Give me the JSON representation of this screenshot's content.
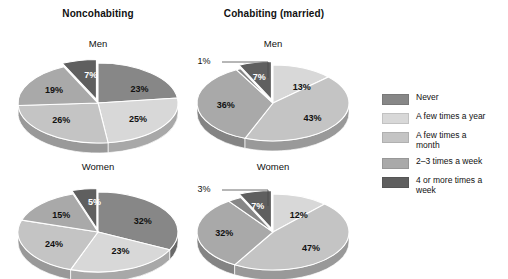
{
  "figure": {
    "group_titles": [
      {
        "id": "noncohabiting",
        "label": "Noncohabiting"
      },
      {
        "id": "cohabiting",
        "label": "Cohabiting (married)"
      }
    ],
    "panel_titles": {
      "men": "Men",
      "women": "Women"
    }
  },
  "legend": {
    "position": "right",
    "items": [
      {
        "label": "Never",
        "color": "#878787"
      },
      {
        "label": "A few times a year",
        "color": "#d8d8d8"
      },
      {
        "label": "A few times a\nmonth",
        "color": "#c4c4c4"
      },
      {
        "label": "2–3 times a week",
        "color": "#a9a9a9"
      },
      {
        "label": "4 or more times a\nweek",
        "color": "#5f5f5f"
      }
    ]
  },
  "chart_data": [
    {
      "type": "pie",
      "id": "noncohabiting-men",
      "title": "Noncohabiting",
      "subtitle": "Men",
      "categories": [
        "Never",
        "A few times a year",
        "A few times a month",
        "2–3 times a week",
        "4 or more times a week"
      ],
      "values": [
        23,
        25,
        26,
        19,
        7
      ],
      "labels": [
        "23%",
        "25%",
        "26%",
        "19%",
        "7%"
      ],
      "colors": [
        "#878787",
        "#d8d8d8",
        "#c4c4c4",
        "#a9a9a9",
        "#5f5f5f"
      ],
      "xlabel": "",
      "ylabel": "",
      "grid": false
    },
    {
      "type": "pie",
      "id": "cohabiting-men",
      "title": "Cohabiting (married)",
      "subtitle": "Men",
      "categories": [
        "Never",
        "A few times a year",
        "A few times a month",
        "2–3 times a week",
        "4 or more times a week"
      ],
      "values": [
        13,
        43,
        36,
        1,
        7
      ],
      "labels": [
        "13%",
        "43%",
        "36%",
        "1%",
        "7%"
      ],
      "colors": [
        "#d8d8d8",
        "#c4c4c4",
        "#a9a9a9",
        "#878787",
        "#5f5f5f"
      ],
      "callouts": [
        "1%"
      ],
      "xlabel": "",
      "ylabel": "",
      "grid": false
    },
    {
      "type": "pie",
      "id": "noncohabiting-women",
      "title": "Noncohabiting",
      "subtitle": "Women",
      "categories": [
        "Never",
        "A few times a year",
        "A few times a month",
        "2–3 times a week",
        "4 or more times a week"
      ],
      "values": [
        32,
        23,
        24,
        15,
        5
      ],
      "labels": [
        "32%",
        "23%",
        "24%",
        "15%",
        "5%"
      ],
      "colors": [
        "#878787",
        "#d8d8d8",
        "#c4c4c4",
        "#a9a9a9",
        "#5f5f5f"
      ],
      "xlabel": "",
      "ylabel": "",
      "grid": false
    },
    {
      "type": "pie",
      "id": "cohabiting-women",
      "title": "Cohabiting (married)",
      "subtitle": "Women",
      "categories": [
        "Never",
        "A few times a year",
        "A few times a month",
        "2–3 times a week",
        "4 or more times a week"
      ],
      "values": [
        12,
        47,
        32,
        3,
        7
      ],
      "labels": [
        "12%",
        "47%",
        "32%",
        "3%",
        "7%"
      ],
      "colors": [
        "#d8d8d8",
        "#c4c4c4",
        "#a9a9a9",
        "#878787",
        "#5f5f5f"
      ],
      "callouts": [
        "3%"
      ],
      "xlabel": "",
      "ylabel": "",
      "grid": false
    }
  ],
  "pie_geometry": [
    {
      "id": "noncohabiting-men",
      "cx": 98,
      "cy": 103,
      "rx": 80,
      "ry": 40,
      "depth": 10,
      "start_deg": -90,
      "slices": [
        {
          "v": 23,
          "color": "#878787",
          "label": "23%",
          "lx": 0.52,
          "ly": -0.34,
          "light": false
        },
        {
          "v": 25,
          "color": "#d8d8d8",
          "label": "25%",
          "lx": 0.5,
          "ly": 0.4,
          "light": false
        },
        {
          "v": 26,
          "color": "#c4c4c4",
          "label": "26%",
          "lx": -0.46,
          "ly": 0.42,
          "light": false
        },
        {
          "v": 19,
          "color": "#a9a9a9",
          "label": "19%",
          "lx": -0.55,
          "ly": -0.32,
          "light": false
        },
        {
          "v": 7,
          "color": "#5f5f5f",
          "label": "7%",
          "lx": -0.07,
          "ly": -0.62,
          "light": true,
          "explode": 8
        }
      ]
    },
    {
      "id": "cohabiting-men",
      "cx": 273,
      "cy": 103,
      "rx": 76,
      "ry": 38,
      "depth": 10,
      "start_deg": -90,
      "slices": [
        {
          "v": 13,
          "color": "#d8d8d8",
          "label": "13%",
          "lx": 0.38,
          "ly": -0.42,
          "light": false
        },
        {
          "v": 43,
          "color": "#c4c4c4",
          "label": "43%",
          "lx": 0.52,
          "ly": 0.4,
          "light": false
        },
        {
          "v": 36,
          "color": "#a9a9a9",
          "label": "36%",
          "lx": -0.62,
          "ly": 0.05,
          "light": false
        },
        {
          "v": 1,
          "color": "#878787",
          "label": "",
          "lx": -0.3,
          "ly": -0.7,
          "light": false
        },
        {
          "v": 7,
          "color": "#5f5f5f",
          "label": "7%",
          "lx": -0.16,
          "ly": -0.6,
          "light": true,
          "explode": 8
        }
      ],
      "callout": {
        "text": "1%",
        "tx": 204,
        "ty": 64,
        "path": "M 222 62 L 268 62 L 268 78"
      }
    },
    {
      "id": "noncohabiting-women",
      "cx": 98,
      "cy": 232,
      "rx": 80,
      "ry": 40,
      "depth": 10,
      "start_deg": -90,
      "slices": [
        {
          "v": 32,
          "color": "#878787",
          "label": "32%",
          "lx": 0.56,
          "ly": -0.28,
          "light": false
        },
        {
          "v": 23,
          "color": "#d8d8d8",
          "label": "23%",
          "lx": 0.28,
          "ly": 0.48,
          "light": false
        },
        {
          "v": 24,
          "color": "#c4c4c4",
          "label": "24%",
          "lx": -0.55,
          "ly": 0.3,
          "light": false
        },
        {
          "v": 15,
          "color": "#a9a9a9",
          "label": "15%",
          "lx": -0.46,
          "ly": -0.42,
          "light": false
        },
        {
          "v": 5,
          "color": "#5f5f5f",
          "label": "5%",
          "lx": -0.03,
          "ly": -0.66,
          "light": true,
          "explode": 8
        }
      ]
    },
    {
      "id": "cohabiting-women",
      "cx": 273,
      "cy": 232,
      "rx": 76,
      "ry": 38,
      "depth": 10,
      "start_deg": -90,
      "slices": [
        {
          "v": 12,
          "color": "#d8d8d8",
          "label": "12%",
          "lx": 0.34,
          "ly": -0.44,
          "light": false
        },
        {
          "v": 47,
          "color": "#c4c4c4",
          "label": "47%",
          "lx": 0.5,
          "ly": 0.42,
          "light": false
        },
        {
          "v": 32,
          "color": "#a9a9a9",
          "label": "32%",
          "lx": -0.64,
          "ly": 0.02,
          "light": false
        },
        {
          "v": 3,
          "color": "#878787",
          "label": "",
          "lx": -0.28,
          "ly": -0.7,
          "light": false
        },
        {
          "v": 7,
          "color": "#5f5f5f",
          "label": "7%",
          "lx": -0.18,
          "ly": -0.58,
          "light": true,
          "explode": 8
        }
      ],
      "callout": {
        "text": "3%",
        "tx": 204,
        "ty": 192,
        "path": "M 222 190 L 268 190 L 268 206"
      }
    }
  ],
  "title_positions": [
    {
      "bind": "figure.group_titles.0.label",
      "left": 38,
      "top": 8,
      "width": 120
    },
    {
      "bind": "figure.group_titles.1.label",
      "left": 210,
      "top": 8,
      "width": 130
    }
  ],
  "subtitle_positions": [
    {
      "bind": "figure.panel_titles.men",
      "left": 48,
      "top": 38,
      "width": 100
    },
    {
      "bind": "figure.panel_titles.men",
      "left": 223,
      "top": 38,
      "width": 100
    },
    {
      "bind": "figure.panel_titles.women",
      "left": 48,
      "top": 161,
      "width": 100
    },
    {
      "bind": "figure.panel_titles.women",
      "left": 223,
      "top": 161,
      "width": 100
    }
  ]
}
